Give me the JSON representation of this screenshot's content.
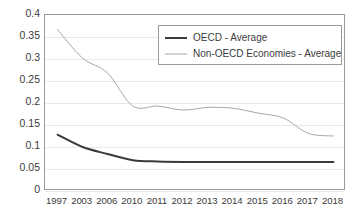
{
  "chart_data": {
    "type": "line",
    "title": "",
    "subtitle": "",
    "xlabel": "",
    "ylabel": "",
    "grid": true,
    "legend_position": "top-right-inside",
    "ylim": [
      0,
      0.4
    ],
    "y_ticks": [
      "0",
      "0.05",
      "0.1",
      "0.15",
      "0.2",
      "0.25",
      "0.3",
      "0.35",
      "0.4"
    ],
    "y_tick_values": [
      0,
      0.05,
      0.1,
      0.15,
      0.2,
      0.25,
      0.3,
      0.35,
      0.4
    ],
    "categories": [
      "1997",
      "2003",
      "2006",
      "2010",
      "2011",
      "2012",
      "2013",
      "2014",
      "2015",
      "2016",
      "2017",
      "2018"
    ],
    "series": [
      {
        "name": "OECD - Average",
        "color": "#3a3a3a",
        "width": 2,
        "values": [
          0.128,
          0.1,
          0.084,
          0.07,
          0.067,
          0.066,
          0.066,
          0.066,
          0.066,
          0.066,
          0.066,
          0.066
        ]
      },
      {
        "name": "Non-OECD Economies - Average",
        "color": "#a8a8a8",
        "width": 1,
        "values": [
          0.367,
          0.302,
          0.268,
          0.193,
          0.193,
          0.184,
          0.19,
          0.188,
          0.177,
          0.166,
          0.131,
          0.125
        ]
      }
    ]
  },
  "legend": {
    "entries": [
      {
        "label": "OECD - Average",
        "style": "thick"
      },
      {
        "label": "Non-OECD Economies - Average",
        "style": "thin"
      }
    ]
  },
  "colors": {
    "oecd": "#3a3a3a",
    "non_oecd": "#a8a8a8",
    "grid": "#e8e8e8",
    "axis": "#9a9a9a",
    "text": "#3b3b3b",
    "background": "#ffffff"
  }
}
